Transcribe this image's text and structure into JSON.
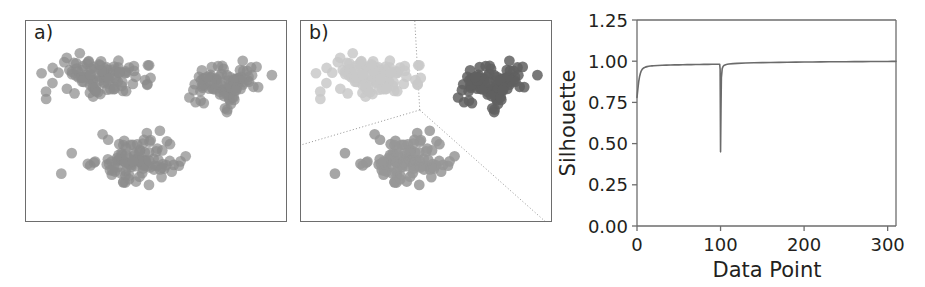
{
  "figure": {
    "panels": [
      {
        "id": "a",
        "label": "a)",
        "caption": "unclustered scatter"
      },
      {
        "id": "b",
        "label": "b)",
        "caption": "clustered scatter with voronoi boundaries"
      },
      {
        "id": "c",
        "label": "c)",
        "caption": "silhouette curve"
      }
    ]
  },
  "panel_a": {
    "label": "a)",
    "point_color": "#8c8c8c",
    "point_opacity": 0.72,
    "frame_color": "#6d6d6d"
  },
  "panel_b": {
    "label": "b)",
    "cluster_colors": [
      "#c9c9c9",
      "#606060",
      "#979797"
    ],
    "cluster_names": [
      "cluster-1-light",
      "cluster-2-dark",
      "cluster-3-medium"
    ],
    "boundary_color": "#9a9a9a",
    "boundary_style": "dotted",
    "frame_color": "#6d6d6d"
  },
  "chart_data": {
    "type": "line",
    "title": "",
    "panel_label": "c)",
    "xlabel": "Data Point",
    "ylabel": "Silhouette",
    "xlim": [
      0,
      310
    ],
    "ylim": [
      0.0,
      1.25
    ],
    "xticks": [
      0,
      100,
      200,
      300
    ],
    "xticklabels": [
      "0",
      "100",
      "200",
      "300"
    ],
    "yticks": [
      0.0,
      0.25,
      0.5,
      0.75,
      1.0,
      1.25
    ],
    "yticklabels": [
      "0.00",
      "0.25",
      "0.50",
      "0.75",
      "1.00",
      "1.25"
    ],
    "grid": false,
    "legend": false,
    "line_color": "#6b6b6b",
    "series": [
      {
        "name": "silhouette",
        "x": [
          0,
          1,
          2,
          3,
          4,
          5,
          6,
          7,
          8,
          9,
          10,
          12,
          14,
          16,
          18,
          20,
          25,
          30,
          35,
          40,
          45,
          50,
          55,
          60,
          65,
          70,
          75,
          80,
          85,
          90,
          93,
          95,
          96,
          97,
          98,
          99,
          99.5,
          100,
          100.5,
          101,
          102,
          103,
          104,
          106,
          108,
          110,
          115,
          120,
          130,
          140,
          150,
          160,
          170,
          180,
          190,
          200,
          210,
          220,
          230,
          240,
          250,
          260,
          270,
          280,
          290,
          300,
          305,
          310
        ],
        "y": [
          0.78,
          0.83,
          0.875,
          0.905,
          0.925,
          0.94,
          0.949,
          0.955,
          0.959,
          0.962,
          0.964,
          0.967,
          0.969,
          0.9705,
          0.9715,
          0.9725,
          0.974,
          0.9752,
          0.976,
          0.9768,
          0.9775,
          0.978,
          0.9786,
          0.979,
          0.9795,
          0.98,
          0.9804,
          0.9808,
          0.981,
          0.9813,
          0.9815,
          0.9816,
          0.9817,
          0.9817,
          0.9818,
          0.9818,
          0.95,
          0.45,
          0.7,
          0.9,
          0.955,
          0.968,
          0.974,
          0.979,
          0.9815,
          0.983,
          0.9855,
          0.987,
          0.989,
          0.9905,
          0.9915,
          0.9925,
          0.993,
          0.9938,
          0.9944,
          0.995,
          0.9955,
          0.996,
          0.9964,
          0.9968,
          0.9971,
          0.9974,
          0.9977,
          0.998,
          0.9983,
          0.9986,
          0.9988,
          0.999
        ]
      }
    ],
    "annotations": [
      {
        "text": "sharp minimum",
        "x": 100,
        "y": 0.45
      }
    ]
  }
}
